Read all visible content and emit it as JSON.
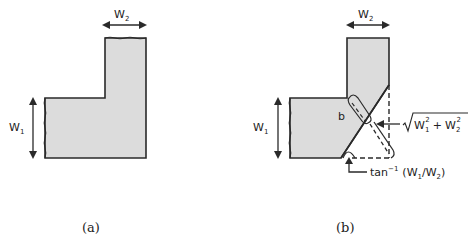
{
  "colors": {
    "fill": "#dcdcdc",
    "stroke": "#2a2a2a",
    "background": "#ffffff"
  },
  "panel_a": {
    "caption": "(a)",
    "labels": {
      "w2": "W",
      "w2_sub": "2",
      "w1": "W",
      "w1_sub": "1"
    }
  },
  "panel_b": {
    "caption": "(b)",
    "labels": {
      "w2": "W",
      "w2_sub": "2",
      "w1": "W",
      "w1_sub": "1",
      "b": "b",
      "sqrt_w1": "W",
      "sqrt_w1_sub": "1",
      "sqrt_w1_sup": "2",
      "sqrt_plus": "+",
      "sqrt_w2": "W",
      "sqrt_w2_sub": "2",
      "sqrt_w2_sup": "2",
      "angle_fn": "tan",
      "angle_fn_sup": "−1",
      "angle_args_open": "(W",
      "angle_arg1_sub": "1",
      "angle_slash": "/W",
      "angle_arg2_sub": "2",
      "angle_args_close": ")"
    }
  }
}
